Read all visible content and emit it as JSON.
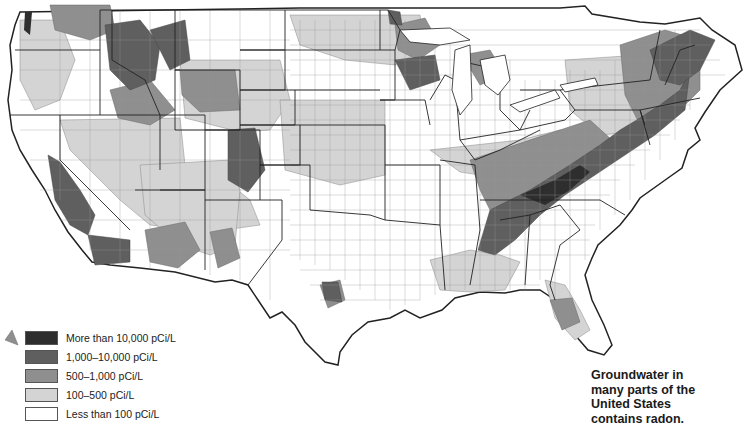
{
  "caption": {
    "lines": [
      "Groundwater in",
      "many parts of the",
      "United States",
      "contains radon."
    ]
  },
  "legend": {
    "items": [
      {
        "label": "More than 10,000 pCi/L",
        "color": "#2e2e2e"
      },
      {
        "label": "1,000–10,000 pCi/L",
        "color": "#5f5f5f"
      },
      {
        "label": "500–1,000 pCi/L",
        "color": "#8f8f8f"
      },
      {
        "label": "100–500 pCi/L",
        "color": "#d4d4d4"
      },
      {
        "label": "Less than 100 pCi/L",
        "color": "#ffffff"
      }
    ]
  },
  "map": {
    "subject": "Radon concentration in groundwater by county, contiguous United States",
    "colors": {
      "outline": "#333333",
      "county_line": "#7a7a7a",
      "land": "#ffffff"
    }
  }
}
